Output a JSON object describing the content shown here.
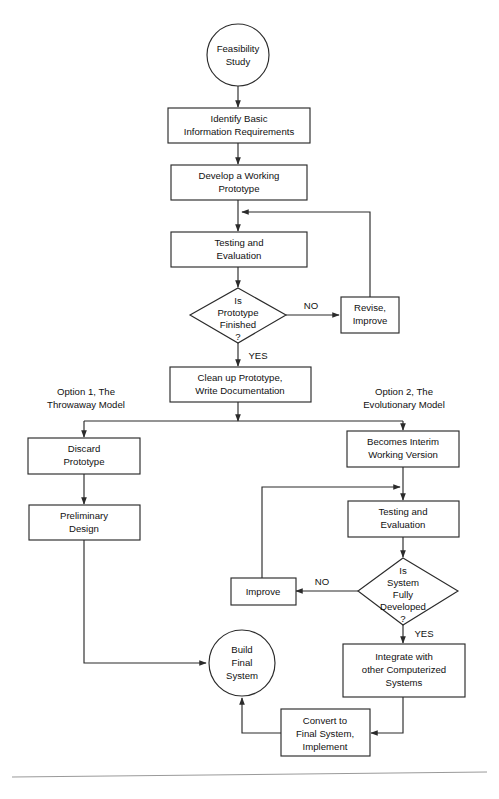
{
  "diagram": {
    "colors": {
      "stroke": "#2b2b2b",
      "text": "#111111",
      "background": "#ffffff",
      "rule": "#9a9a9a"
    },
    "branch_labels": {
      "option1_line1": "Option 1, The",
      "option1_line2": "Throwaway Model",
      "option2_line1": "Option 2, The",
      "option2_line2": "Evolutionary Model"
    },
    "edge_labels": {
      "no_1": "NO",
      "yes_1": "YES",
      "no_2": "NO",
      "yes_2": "YES"
    },
    "nodes": {
      "feasibility_study": {
        "type": "terminator-circle",
        "line1": "Feasibility",
        "line2": "Study"
      },
      "identify_basic": {
        "type": "process",
        "line1": "Identify Basic",
        "line2": "Information Requirements"
      },
      "develop_prototype": {
        "type": "process",
        "line1": "Develop a Working",
        "line2": "Prototype"
      },
      "testing_eval_1": {
        "type": "process",
        "line1": "Testing and",
        "line2": "Evaluation"
      },
      "is_prototype_finished": {
        "type": "decision",
        "line1": "Is",
        "line2": "Prototype",
        "line3": "Finished",
        "line4": "?"
      },
      "revise_improve": {
        "type": "process",
        "line1": "Revise,",
        "line2": "Improve"
      },
      "clean_up_prototype": {
        "type": "process",
        "line1": "Clean up Prototype,",
        "line2": "Write Documentation"
      },
      "discard_prototype": {
        "type": "process",
        "line1": "Discard",
        "line2": "Prototype"
      },
      "preliminary_design": {
        "type": "process",
        "line1": "Preliminary",
        "line2": "Design"
      },
      "becomes_interim": {
        "type": "process",
        "line1": "Becomes Interim",
        "line2": "Working Version"
      },
      "testing_eval_2": {
        "type": "process",
        "line1": "Testing and",
        "line2": "Evaluation"
      },
      "is_system_developed": {
        "type": "decision",
        "line1": "Is",
        "line2": "System",
        "line3": "Fully",
        "line4": "Developed",
        "line5": "?"
      },
      "improve": {
        "type": "process",
        "line1": "Improve"
      },
      "build_final_system": {
        "type": "terminator-circle",
        "line1": "Build",
        "line2": "Final",
        "line3": "System"
      },
      "integrate_with_other": {
        "type": "process",
        "line1": "Integrate with",
        "line2": "other Computerized",
        "line3": "Systems"
      },
      "convert_to_final": {
        "type": "process",
        "line1": "Convert to",
        "line2": "Final System,",
        "line3": "Implement"
      }
    }
  }
}
